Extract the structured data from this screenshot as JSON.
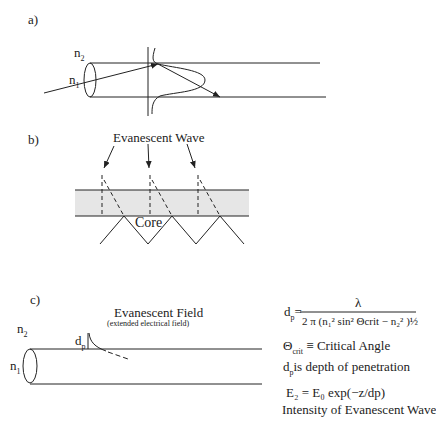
{
  "panels": {
    "a": {
      "label": "a)",
      "n2": "n",
      "n2_sub": "2",
      "n1": "n",
      "n1_sub": "1"
    },
    "b": {
      "label": "b)",
      "title": "Evanescent Wave",
      "core_label": "Core",
      "band_color": "#e6e6e6"
    },
    "c": {
      "label": "c)",
      "title": "Evanescent Field",
      "subtitle": "(extended electrical field)",
      "n2": "n",
      "n2_sub": "2",
      "n1": "n",
      "n1_sub": "1",
      "dp": "d",
      "dp_sub": "p"
    }
  },
  "equations": {
    "dp_lhs": "d",
    "dp_lhs_sub": "p",
    "dp_eq": "=",
    "numerator": "λ",
    "denominator": "2 π (n₁² sin² Θcrit − n₂² )½",
    "critical_angle": "Θcrit ≡ Critical Angle",
    "crit_symbol": "Θ",
    "crit_sub": "crit",
    "crit_text": "≡ Critical Angle",
    "depth_text": "is depth of penetration",
    "depth_symbol": "d",
    "depth_sub": "p",
    "intensity_eq": "E₂ = E₀ exp(−z/dp)",
    "intensity_caption": "Intensity of Evanescent Wave"
  }
}
